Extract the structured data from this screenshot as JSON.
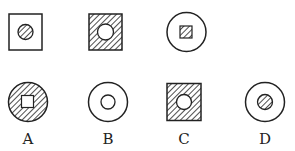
{
  "question_figures": [
    {
      "id": "q1",
      "outer": "square",
      "outer_fill": "white",
      "inner": "circle",
      "inner_fill": "hatched"
    },
    {
      "id": "q2",
      "outer": "square",
      "outer_fill": "hatched",
      "inner": "circle",
      "inner_fill": "white"
    },
    {
      "id": "q3",
      "outer": "circle",
      "outer_fill": "white",
      "inner": "square",
      "inner_fill": "hatched"
    }
  ],
  "options": [
    {
      "label": "A",
      "outer": "circle",
      "outer_fill": "hatched",
      "inner": "square",
      "inner_fill": "white"
    },
    {
      "label": "B",
      "outer": "circle",
      "outer_fill": "white",
      "inner": "circle",
      "inner_fill": "white"
    },
    {
      "label": "C",
      "outer": "square",
      "outer_fill": "hatched",
      "inner": "circle",
      "inner_fill": "white"
    },
    {
      "label": "D",
      "outer": "circle",
      "outer_fill": "white",
      "inner": "circle",
      "inner_fill": "hatched"
    }
  ],
  "colors": {
    "stroke": "#222222",
    "background": "#ffffff"
  }
}
